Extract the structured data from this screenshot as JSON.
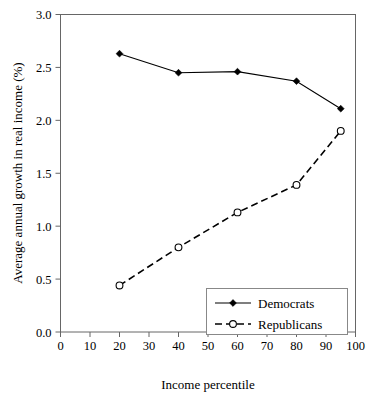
{
  "chart_data": {
    "type": "line",
    "title": "",
    "subtitle": "",
    "xlabel": "Income percentile",
    "ylabel": "Average annual growth in real income (%)",
    "xlim": [
      0,
      100
    ],
    "ylim": [
      0.0,
      3.0
    ],
    "xticks": [
      0,
      10,
      20,
      30,
      40,
      50,
      60,
      70,
      80,
      90,
      100
    ],
    "xtick_labels": [
      "0",
      "10",
      "20",
      "30",
      "40",
      "50",
      "60",
      "70",
      "80",
      "90",
      "100"
    ],
    "yticks": [
      0.0,
      0.5,
      1.0,
      1.5,
      2.0,
      2.5,
      3.0
    ],
    "ytick_labels": [
      "0.0",
      "0.5",
      "1.0",
      "1.5",
      "2.0",
      "2.5",
      "3.0"
    ],
    "grid": false,
    "legend_position": "inside-lower-right",
    "x": [
      20,
      40,
      60,
      80,
      95
    ],
    "series": [
      {
        "name": "Democrats",
        "values": [
          2.63,
          2.45,
          2.46,
          2.37,
          2.11
        ],
        "line_style": "solid",
        "marker": "filled-diamond",
        "color": "#000000"
      },
      {
        "name": "Republicans",
        "values": [
          0.44,
          0.8,
          1.13,
          1.39,
          1.9
        ],
        "line_style": "dashed",
        "marker": "open-circle",
        "color": "#000000"
      }
    ]
  },
  "legend": {
    "entries": [
      {
        "label": "Democrats"
      },
      {
        "label": "Republicans"
      }
    ]
  },
  "axes": {
    "x_title": "Income percentile",
    "y_title": "Average annual growth in real income (%)"
  }
}
